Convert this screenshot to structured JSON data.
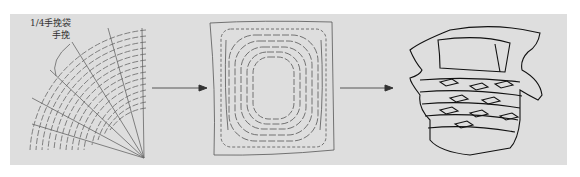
{
  "diagram": {
    "labels": {
      "quarter_bag": "1/4手挽袋",
      "handle": "手挽"
    },
    "stages": [
      {
        "name": "quarter-pattern",
        "description": "Fan-shaped 1/4 pattern with radial and arc stitch lines"
      },
      {
        "name": "square-felt",
        "description": "Square panel with concentric dashed rounded-rectangle stitching"
      },
      {
        "name": "finished-basket",
        "description": "Shaped basket with handle and woven lattice"
      }
    ],
    "arrows": 2,
    "colors": {
      "background": "#dedede",
      "line": "#555555",
      "dark_line": "#111111"
    }
  }
}
